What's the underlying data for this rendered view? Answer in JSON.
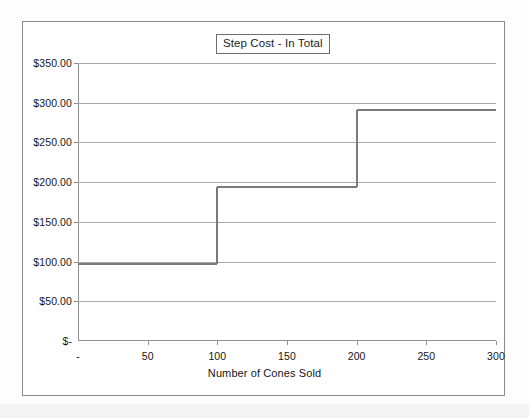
{
  "chart_data": {
    "type": "line",
    "title": "Step Cost - In Total",
    "xlabel": "Number of Cones Sold",
    "ylabel": "",
    "xlim": [
      0,
      300
    ],
    "ylim": [
      0,
      350
    ],
    "grid": true,
    "legend": false,
    "x_ticks": [
      "-",
      "50",
      "100",
      "150",
      "200",
      "250",
      "300"
    ],
    "x_tick_values": [
      0,
      50,
      100,
      150,
      200,
      250,
      300
    ],
    "y_ticks": [
      "$-",
      "$50.00",
      "$100.00",
      "$150.00",
      "$200.00",
      "$250.00",
      "$300.00",
      "$350.00"
    ],
    "y_tick_values": [
      0,
      50,
      100,
      150,
      200,
      250,
      300,
      350
    ],
    "series": [
      {
        "name": "Step Cost - In Total",
        "color": "#7b7b7b",
        "step": "post",
        "x": [
          0,
          100,
          100,
          200,
          200,
          300
        ],
        "y": [
          97,
          97,
          194,
          194,
          291,
          291
        ],
        "segments": [
          {
            "x_start": 0,
            "x_end": 100,
            "value": 97
          },
          {
            "x_start": 100,
            "x_end": 200,
            "value": 194
          },
          {
            "x_start": 200,
            "x_end": 300,
            "value": 291
          }
        ]
      }
    ]
  },
  "colors": {
    "frame": "#8a8a8a",
    "gridline": "#a9a9a9",
    "axis": "#909090",
    "series": "#7b7b7b",
    "text": "#161616",
    "background": "#ffffff"
  }
}
